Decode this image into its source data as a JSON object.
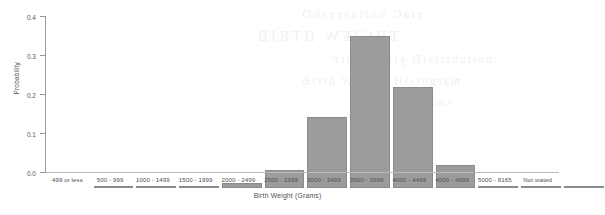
{
  "chart_data": {
    "type": "bar",
    "title": "",
    "xlabel": "Birth Weight (Grams)",
    "ylabel": "Probability",
    "categories": [
      "499 or less",
      "500 - 999",
      "1000 - 1499",
      "1500 - 1999",
      "2000 - 2499",
      "2500 - 2999",
      "3000 - 3499",
      "3500 - 3999",
      "4000 - 4499",
      "4500 - 4999",
      "5000 - 8165",
      "Not stated"
    ],
    "values": [
      0.002,
      0.004,
      0.005,
      0.012,
      0.047,
      0.183,
      0.389,
      0.26,
      0.06,
      0.006,
      0.001,
      0.001
    ],
    "ylim": [
      0.0,
      0.4
    ],
    "ytick_labels": [
      "0.0",
      "0.1",
      "0.2",
      "0.3",
      "0.4"
    ],
    "ytick_values": [
      0.0,
      0.1,
      0.2,
      0.3,
      0.4
    ],
    "grid": false,
    "legend": null,
    "bar_color": "#9b9c9c",
    "bar_edge_color": "#8a8b8b",
    "axis_color": "#9a9a9a",
    "background": "#ffffff"
  },
  "scan_artifacts": {
    "bleed_lines": [
      "etaC noitavresbO",
      "THGIEW HTRIB",
      "noitubirtsiD ytilibaborP",
      "margotsiH thgieW htriB",
      "smarG ni thgieW"
    ]
  }
}
